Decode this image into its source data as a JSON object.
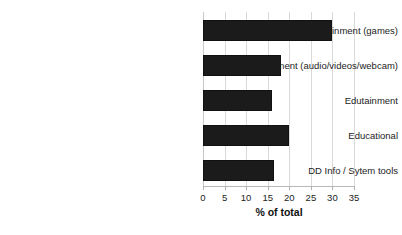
{
  "chart_data": {
    "type": "bar",
    "orientation": "horizontal",
    "title": "",
    "subtitle": "",
    "xlabel": "% of total",
    "ylabel": "",
    "categories": [
      "Entertainment (games)",
      "Entertainment (audio/videos/webcam)",
      "Edutainment",
      "Educational",
      "DD Info / Sytem tools"
    ],
    "values": [
      30,
      18,
      16,
      20,
      16.5
    ],
    "xlim": [
      0,
      35
    ],
    "xticks": [
      0,
      5,
      10,
      15,
      20,
      25,
      30,
      35
    ],
    "xtick_labels": [
      "0",
      "5",
      "10",
      "15",
      "20",
      "25",
      "30",
      "35"
    ],
    "grid": true,
    "grid_axis": "x",
    "legend": false,
    "legend_position": "none",
    "bar_color": "#1b1b1b",
    "grid_color": "#d9d9d9",
    "background_color": "#ffffff",
    "text_color": "#1c1c1c"
  }
}
